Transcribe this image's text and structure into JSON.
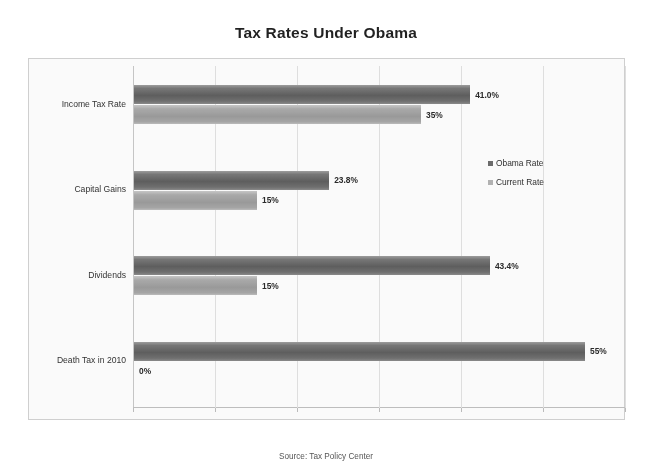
{
  "chart_data": {
    "type": "bar",
    "orientation": "horizontal",
    "title": "Tax Rates Under Obama",
    "xlabel": "",
    "ylabel": "",
    "categories": [
      "Income Tax Rate",
      "Capital Gains",
      "Dividends",
      "Death Tax in 2010"
    ],
    "series": [
      {
        "name": "Obama Rate",
        "color": "#6a6a6a",
        "values": [
          41.0,
          23.8,
          43.4,
          55
        ],
        "labels": [
          "41.0%",
          "23.8%",
          "43.4%",
          "55%"
        ]
      },
      {
        "name": "Current Rate",
        "color": "#b3b3b3",
        "values": [
          35,
          15,
          15,
          0
        ],
        "labels": [
          "35%",
          "15%",
          "15%",
          "0%"
        ]
      }
    ],
    "xlim": [
      0,
      60
    ],
    "xticks": [
      0,
      10,
      20,
      30,
      40,
      50,
      60
    ],
    "grid": true,
    "legend_position": "right-middle",
    "legend_entries": [
      "Obama Rate",
      "Current Rate"
    ]
  },
  "source_note": "Source: Tax Policy Center"
}
